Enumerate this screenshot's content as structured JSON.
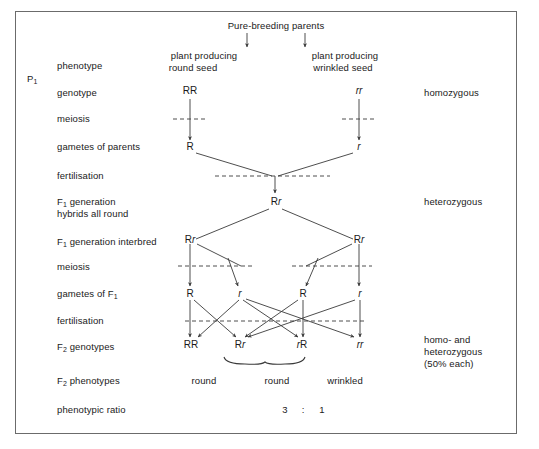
{
  "diagram": {
    "title_note": "Monohybrid cross: round vs wrinkled pea seed",
    "top_caption": "Pure-breeding parents",
    "generation_p1": "P",
    "generation_p1_sub": "1",
    "row_labels": {
      "phenotype": "phenotype",
      "genotype": "genotype",
      "meiosis_1": "meiosis",
      "gametes_parents": "gametes of parents",
      "fertilisation_1": "fertilisation",
      "f1_generation": "F",
      "f1_generation_sub": "1",
      "f1_generation_rest": " generation",
      "f1_hybrids": "hybrids all round",
      "f1_interbred": "F",
      "f1_interbred_sub": "1",
      "f1_interbred_rest": " generation interbred",
      "meiosis_2": "meiosis",
      "gametes_f1": "gametes of F",
      "gametes_f1_sub": "1",
      "fertilisation_2": "fertilisation",
      "f2_genotypes": "F",
      "f2_genotypes_sub": "2",
      "f2_genotypes_rest": " genotypes",
      "f2_phenotypes": "F",
      "f2_phenotypes_sub": "2",
      "f2_phenotypes_rest": " phenotypes",
      "phenotypic_ratio": "phenotypic ratio"
    },
    "parents": {
      "left_phenotype_line1": "plant producing",
      "left_phenotype_line2": "round seed",
      "right_phenotype_line1": "plant producing",
      "right_phenotype_line2": "wrinkled seed",
      "left_genotype": "RR",
      "right_genotype": "rr",
      "left_gamete": "R",
      "right_gamete": "r"
    },
    "f1": {
      "zygote_genotype_dom": "R",
      "zygote_genotype_rec": "r",
      "left_parent_dom": "R",
      "left_parent_rec": "r",
      "right_parent_dom": "R",
      "right_parent_rec": "r",
      "gamete_1": "R",
      "gamete_2": "r",
      "gamete_3": "R",
      "gamete_4": "r"
    },
    "f2": {
      "genotypes": [
        {
          "dom": "RR",
          "rec": "",
          "display": "RR"
        },
        {
          "dom": "R",
          "rec": "r",
          "display": "Rr"
        },
        {
          "dom": "R",
          "rec": "r",
          "display": "rR"
        },
        {
          "dom": "",
          "rec": "rr",
          "display": "rr"
        }
      ],
      "phenotype_1": "round",
      "phenotype_2": "round",
      "phenotype_3": "wrinkled",
      "ratio_left": "3",
      "ratio_colon": ":",
      "ratio_right": "1"
    },
    "annotations": {
      "homozygous": "homozygous",
      "heterozygous": "heterozygous",
      "f2_zygosity_line1": "homo- and",
      "f2_zygosity_line2": "heterozygous",
      "f2_zygosity_line3": "(50% each)"
    },
    "colors": {
      "ink": "#1a1a1a",
      "line": "#3a3a3a",
      "border": "#6b6b6b",
      "background": "#ffffff"
    }
  }
}
